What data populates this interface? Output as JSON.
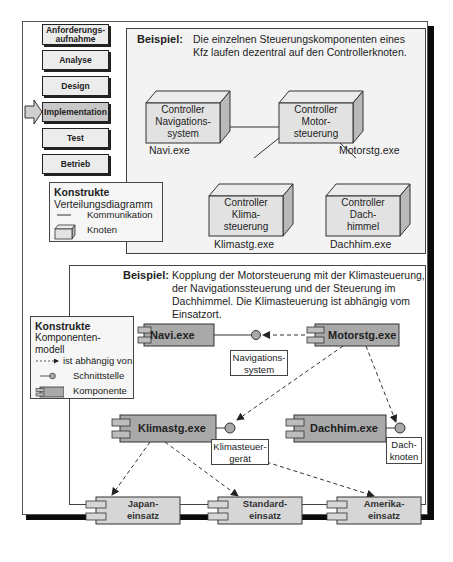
{
  "phases": [
    {
      "label": "Anforderungs-\naufnahme",
      "active": false
    },
    {
      "label": "Analyse",
      "active": false
    },
    {
      "label": "Design",
      "active": false
    },
    {
      "label": "Implementation",
      "active": true
    },
    {
      "label": "Test",
      "active": false
    },
    {
      "label": "Betrieb",
      "active": false
    }
  ],
  "top_example": {
    "label": "Beispiel:",
    "text_line1": "Die einzelnen Steuerungskomponenten eines",
    "text_line2": "Kfz laufen dezentral auf den Controllerknoten.",
    "nodes": [
      {
        "id": "navi",
        "lines": [
          "Controller",
          "Navigations-",
          "system"
        ],
        "exe": "Navi.exe"
      },
      {
        "id": "motor",
        "lines": [
          "Controller",
          "Motor-",
          "steuerung"
        ],
        "exe": "Motorstg.exe"
      },
      {
        "id": "klima",
        "lines": [
          "Controller",
          "Klima-",
          "steuerung"
        ],
        "exe": "Klimastg.exe"
      },
      {
        "id": "dach",
        "lines": [
          "Controller",
          "Dach-",
          "himmel"
        ],
        "exe": "Dachhim.exe"
      }
    ]
  },
  "legend_top": {
    "title": "Konstrukte",
    "subtitle": "Verteilungsdiagramm",
    "items": [
      {
        "icon": "line",
        "label": "Kommunikation"
      },
      {
        "icon": "node-box",
        "label": "Knoten"
      }
    ]
  },
  "bottom_example": {
    "label": "Beispiel:",
    "text_line1": "Kopplung der Motorsteuerung mit der Klimasteuerung,",
    "text_line2": "der Navigationssteuerung und der Steuerung im",
    "text_line3": "Dachhimmel. Die Klimasteuerung ist abhängig vom",
    "text_line4": "Einsatzort.",
    "components": [
      {
        "id": "navi",
        "label": "Navi.exe"
      },
      {
        "id": "motor",
        "label": "Motorstg.exe"
      },
      {
        "id": "klima",
        "label": "Klimastg.exe"
      },
      {
        "id": "dach",
        "label": "Dachhim.exe"
      },
      {
        "id": "japan",
        "label_l1": "Japan-",
        "label_l2": "einsatz"
      },
      {
        "id": "standard",
        "label_l1": "Standard-",
        "label_l2": "einsatz"
      },
      {
        "id": "amerika",
        "label_l1": "Amerika-",
        "label_l2": "einsatz"
      }
    ],
    "interfaces": [
      {
        "id": "navsys",
        "l1": "Navigations-",
        "l2": "system"
      },
      {
        "id": "klimageraet",
        "l1": "Klimasteuer-",
        "l2": "gerät"
      },
      {
        "id": "dachknoten",
        "l1": "Dach-",
        "l2": "knoten"
      }
    ]
  },
  "legend_bottom": {
    "title": "Konstrukte",
    "subtitle_l1": "Komponenten-",
    "subtitle_l2": "modell",
    "items": [
      {
        "icon": "dashed-arrow",
        "label": "ist abhängig von"
      },
      {
        "icon": "lollipop",
        "label": "Schnittstelle"
      },
      {
        "icon": "component",
        "label": "Komponente"
      }
    ]
  },
  "colors": {
    "panel_bg": "#f3f3f3",
    "component_dark": "#a9a9a9",
    "component_light": "#d6d6d6",
    "node_face": "#e2e2e2",
    "node_side": "#b9b9b9"
  }
}
